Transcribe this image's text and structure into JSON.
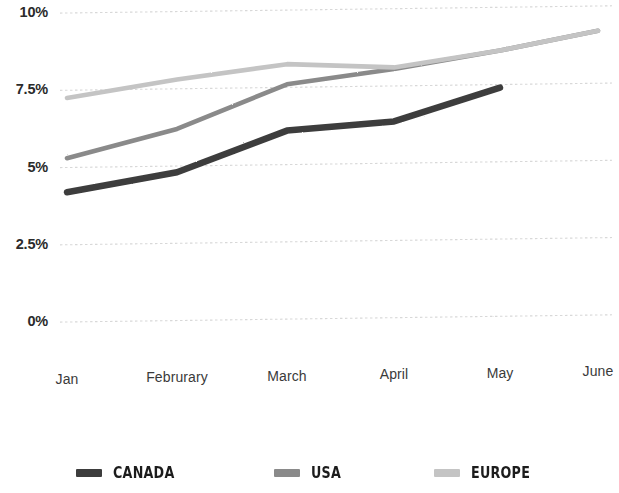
{
  "chart_data": {
    "type": "line",
    "title": "",
    "xlabel": "",
    "ylabel": "",
    "categories": [
      "Jan",
      "Februrary",
      "March",
      "April",
      "May",
      "June"
    ],
    "ylim": [
      0,
      10
    ],
    "yticks": [
      0,
      2.5,
      5,
      7.5,
      10
    ],
    "ytick_labels": [
      "0%",
      "2.5%",
      "5%",
      "7.5%",
      "10%"
    ],
    "grid": true,
    "grid_axis": "y",
    "legend_position": "bottom",
    "value_suffix": "%",
    "series": [
      {
        "name": "CANADA",
        "color": "#3d3d3d",
        "values": [
          4.2,
          4.8,
          6.1,
          6.35,
          7.4,
          null
        ]
      },
      {
        "name": "USA",
        "color": "#8a8a8a",
        "values": [
          5.3,
          6.2,
          7.6,
          8.05,
          8.6,
          9.2
        ]
      },
      {
        "name": "EUROPE",
        "color": "#c4c4c4",
        "values": [
          7.25,
          7.8,
          8.25,
          8.1,
          8.6,
          9.2
        ]
      }
    ]
  },
  "axis": {
    "y_labels": [
      "10%",
      "7.5%",
      "5%",
      "2.5%",
      "0%"
    ],
    "x_labels": [
      "Jan",
      "Februrary",
      "March",
      "April",
      "May",
      "June"
    ]
  },
  "legend": {
    "items": [
      {
        "label": "CANADA",
        "color": "#3d3d3d"
      },
      {
        "label": "USA",
        "color": "#8a8a8a"
      },
      {
        "label": "EUROPE",
        "color": "#c4c4c4"
      }
    ]
  }
}
